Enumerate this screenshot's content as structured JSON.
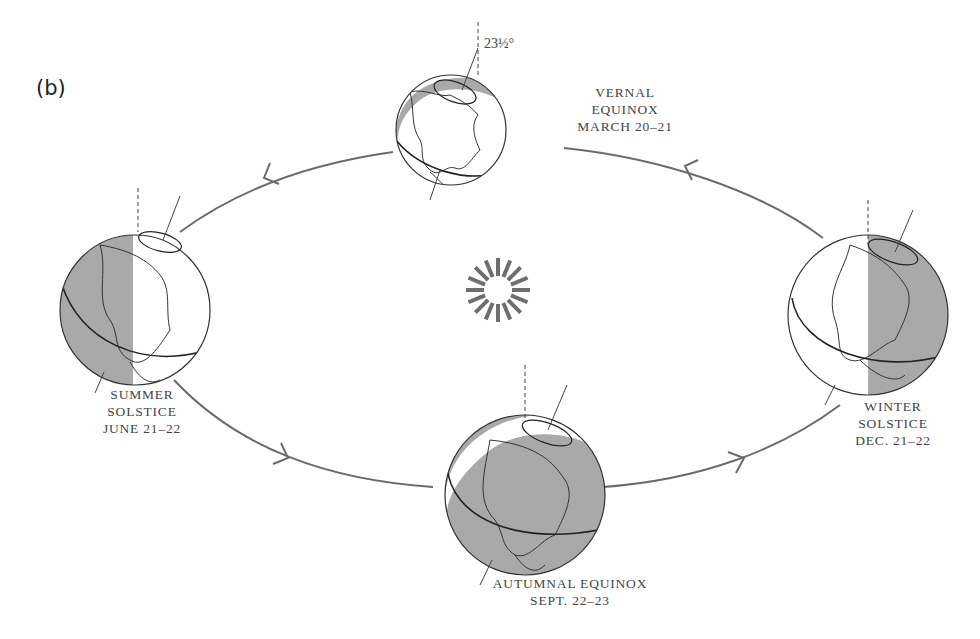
{
  "figure": {
    "panel_label": "(b)",
    "tilt_angle_label": "23½°",
    "colors": {
      "orbit": "#6b6b6b",
      "shade": "#a9a9a9",
      "outline": "#333333",
      "text": "#444444"
    }
  },
  "positions": {
    "vernal": {
      "line1": "VERNAL",
      "line2": "EQUINOX",
      "line3": "MARCH 20–21"
    },
    "summer": {
      "line1": "SUMMER",
      "line2": "SOLSTICE",
      "line3": "JUNE 21–22"
    },
    "winter": {
      "line1": "WINTER",
      "line2": "SOLSTICE",
      "line3": "DEC. 21–22"
    },
    "autumnal": {
      "line1": "AUTUMNAL EQUINOX",
      "line2": "SEPT. 22–23"
    }
  },
  "sun": {
    "icon": "sun-icon",
    "rays": 16
  }
}
